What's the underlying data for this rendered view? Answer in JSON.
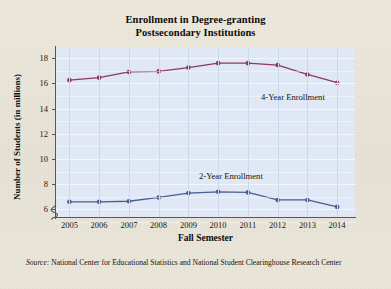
{
  "chart_data": {
    "type": "line",
    "title": "Enrollment in Degree-granting Postsecondary Institutions",
    "title_line1": "Enrollment in Degree-granting",
    "title_line2": "Postsecondary Institutions",
    "xlabel": "Fall Semester",
    "ylabel": "Number of Students (in millions)",
    "categories": [
      2005,
      2006,
      2007,
      2008,
      2009,
      2010,
      2011,
      2012,
      2013,
      2014
    ],
    "xtick_labels": [
      "2005",
      "2006",
      "2007",
      "2008",
      "2009",
      "2010",
      "2011",
      "2012",
      "2013",
      "2014"
    ],
    "ytick_labels": [
      "6",
      "8",
      "10",
      "12",
      "14",
      "16",
      "18"
    ],
    "yticks": [
      6,
      8,
      10,
      12,
      14,
      16,
      18
    ],
    "ylim": [
      5.4,
      18.8
    ],
    "xlim": [
      2004.55,
      2014.6
    ],
    "axis_break": true,
    "grid": true,
    "legend_position": "inline-annotation",
    "series": [
      {
        "name": "4-Year Enrollment",
        "color": "#8e3a5c",
        "values": [
          16.25,
          16.45,
          16.9,
          16.95,
          17.25,
          17.6,
          17.6,
          17.45,
          16.7,
          16.05
        ]
      },
      {
        "name": "2-Year Enrollment",
        "color": "#4a5e90",
        "values": [
          6.6,
          6.6,
          6.65,
          6.95,
          7.3,
          7.4,
          7.35,
          6.75,
          6.75,
          6.2
        ]
      }
    ],
    "annotations": [
      {
        "text": "4-Year Enrollment",
        "series": "4-Year Enrollment"
      },
      {
        "text": "2-Year Enrollment",
        "series": "2-Year Enrollment"
      }
    ],
    "source_prefix": "Source:",
    "source_text": "National Center for Educational Statistics and National Student Clearinghouse Research Center"
  },
  "colors": {
    "page_background": "#e8e4d8",
    "plot_background": "#dfe8f4",
    "gridline_vertical": "#ccd9ec",
    "gridline_horizontal": "#f3f7fc",
    "axis": "#5a5550",
    "series_4year": "#8e3a5c",
    "series_2year": "#4a5e90",
    "text": "#100d0a"
  }
}
